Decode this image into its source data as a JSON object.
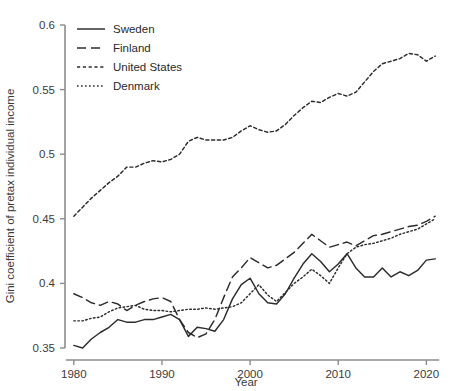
{
  "chart_data": {
    "type": "line",
    "title": "",
    "xlabel": "Year",
    "ylabel": "Gini coefficient of pretax individual income",
    "xlim": [
      1979,
      2022
    ],
    "ylim": [
      0.35,
      0.6
    ],
    "grid": false,
    "legend_position": "top-left",
    "x_ticks": [
      "1980",
      "1990",
      "2000",
      "2010",
      "2020"
    ],
    "x_tick_values": [
      1980,
      1990,
      2000,
      2010,
      2020
    ],
    "y_ticks": [
      "0.35",
      "0.4",
      "0.45",
      "0.5",
      "0.55",
      "0.6"
    ],
    "y_tick_values": [
      0.35,
      0.4,
      0.45,
      0.5,
      0.55,
      0.6
    ],
    "x": [
      1980,
      1981,
      1982,
      1983,
      1984,
      1985,
      1986,
      1987,
      1988,
      1989,
      1990,
      1991,
      1992,
      1993,
      1994,
      1995,
      1996,
      1997,
      1998,
      1999,
      2000,
      2001,
      2002,
      2003,
      2004,
      2005,
      2006,
      2007,
      2008,
      2009,
      2010,
      2011,
      2012,
      2013,
      2014,
      2015,
      2016,
      2017,
      2018,
      2019,
      2020,
      2021
    ],
    "series": [
      {
        "name": "Sweden",
        "style": "solid",
        "color": "#2c2c2c",
        "values": [
          0.352,
          0.35,
          0.357,
          0.362,
          0.366,
          0.372,
          0.37,
          0.37,
          0.372,
          0.372,
          0.374,
          0.376,
          0.372,
          0.359,
          0.366,
          0.365,
          0.363,
          0.372,
          0.388,
          0.399,
          0.404,
          0.392,
          0.385,
          0.384,
          0.392,
          0.404,
          0.415,
          0.423,
          0.417,
          0.409,
          0.415,
          0.423,
          0.412,
          0.405,
          0.405,
          0.412,
          0.405,
          0.409,
          0.406,
          0.41,
          0.418,
          0.419
        ]
      },
      {
        "name": "Finland",
        "style": "dashed",
        "color": "#2c2c2c",
        "values": [
          0.392,
          0.389,
          0.385,
          0.383,
          0.386,
          0.384,
          0.379,
          0.383,
          0.386,
          0.388,
          0.389,
          0.386,
          0.372,
          0.362,
          0.358,
          0.361,
          0.372,
          0.389,
          0.405,
          0.412,
          0.42,
          0.416,
          0.412,
          0.414,
          0.419,
          0.424,
          0.431,
          0.438,
          0.433,
          0.428,
          0.43,
          0.432,
          0.429,
          0.433,
          0.437,
          0.438,
          0.44,
          0.442,
          0.444,
          0.445,
          0.448,
          0.452
        ]
      },
      {
        "name": "United States",
        "style": "dotted-dash",
        "color": "#2c2c2c",
        "values": [
          0.452,
          0.459,
          0.466,
          0.472,
          0.478,
          0.483,
          0.49,
          0.49,
          0.493,
          0.495,
          0.494,
          0.496,
          0.5,
          0.51,
          0.513,
          0.511,
          0.511,
          0.511,
          0.513,
          0.518,
          0.522,
          0.519,
          0.517,
          0.518,
          0.523,
          0.53,
          0.536,
          0.541,
          0.54,
          0.544,
          0.547,
          0.545,
          0.548,
          0.556,
          0.564,
          0.57,
          0.572,
          0.574,
          0.578,
          0.577,
          0.572,
          0.576
        ]
      },
      {
        "name": "Denmark",
        "style": "dotted",
        "color": "#2c2c2c",
        "values": [
          0.371,
          0.371,
          0.373,
          0.374,
          0.378,
          0.381,
          0.382,
          0.383,
          0.38,
          0.379,
          0.379,
          0.378,
          0.379,
          0.38,
          0.38,
          0.381,
          0.38,
          0.381,
          0.382,
          0.385,
          0.392,
          0.399,
          0.391,
          0.386,
          0.393,
          0.4,
          0.405,
          0.411,
          0.406,
          0.4,
          0.412,
          0.423,
          0.428,
          0.43,
          0.431,
          0.433,
          0.435,
          0.438,
          0.44,
          0.442,
          0.446,
          0.45
        ]
      }
    ]
  },
  "legend": {
    "items": [
      {
        "label": "Sweden"
      },
      {
        "label": "Finland"
      },
      {
        "label": "United States"
      },
      {
        "label": "Denmark"
      }
    ]
  }
}
